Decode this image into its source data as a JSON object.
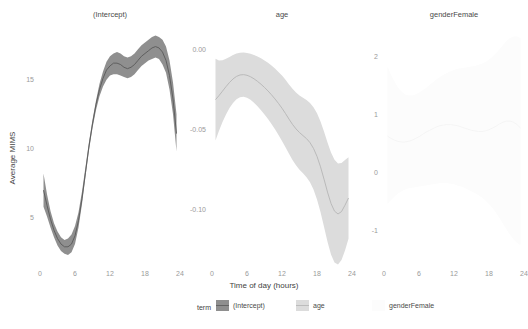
{
  "figure": {
    "background": "#ffffff",
    "axis_label_x": "Time of day (hours)",
    "axis_label_y": "Average MIMS"
  },
  "legend": {
    "title": "term",
    "position": "bottom",
    "entries": [
      {
        "label": "(Intercept)",
        "color": "#8f8f8f",
        "line_color": "#595959"
      },
      {
        "label": "age",
        "color": "#dcdcdc",
        "line_color": "#b4b4b4"
      },
      {
        "label": "genderFemale",
        "color": "#fcfcfc",
        "line_color": "#f2f2f2"
      }
    ]
  },
  "chart_data": {
    "type": "line",
    "title": "",
    "subtitle": "",
    "xlabel": "Time of day (hours)",
    "ylabel": "Average MIMS",
    "grid": false,
    "legend_position": "bottom",
    "facets": [
      {
        "name": "(Intercept)",
        "title": "(Intercept)",
        "color": "#8f8f8f",
        "line_color": "#595959",
        "xlim": [
          0,
          24
        ],
        "ylim": [
          1.8,
          18.6
        ],
        "xticks": [
          0,
          6,
          12,
          18,
          24
        ],
        "xtick_labels": [
          "0",
          "6",
          "12",
          "18",
          "24"
        ],
        "yticks": [
          5,
          10,
          15
        ],
        "ytick_labels": [
          "5",
          "10",
          "15"
        ],
        "x": [
          0.6,
          1.2,
          1.8,
          2.4,
          3.0,
          3.6,
          4.2,
          4.8,
          5.4,
          6.0,
          6.6,
          7.2,
          7.8,
          8.4,
          9.0,
          9.6,
          10.2,
          10.8,
          11.4,
          12.0,
          12.6,
          13.2,
          13.8,
          14.4,
          15.0,
          15.6,
          16.2,
          16.8,
          17.4,
          18.0,
          18.6,
          19.2,
          19.8,
          20.4,
          21.0,
          21.6,
          22.2,
          22.8,
          23.4
        ],
        "fit": [
          7.0,
          5.9,
          4.9,
          4.1,
          3.5,
          3.1,
          2.9,
          2.9,
          3.1,
          3.7,
          4.8,
          6.4,
          8.3,
          10.2,
          11.8,
          13.2,
          14.3,
          15.1,
          15.7,
          16.0,
          16.2,
          16.2,
          16.1,
          15.9,
          15.8,
          15.9,
          16.1,
          16.4,
          16.7,
          16.9,
          17.1,
          17.3,
          17.4,
          17.3,
          17.0,
          16.4,
          15.3,
          13.6,
          11.1
        ],
        "lower": [
          5.8,
          5.1,
          4.3,
          3.6,
          3.0,
          2.6,
          2.4,
          2.3,
          2.5,
          3.1,
          4.3,
          6.0,
          8.0,
          9.9,
          11.5,
          12.8,
          13.8,
          14.5,
          15.0,
          15.3,
          15.4,
          15.4,
          15.3,
          15.2,
          15.1,
          15.2,
          15.4,
          15.7,
          16.0,
          16.2,
          16.4,
          16.5,
          16.6,
          16.5,
          16.1,
          15.5,
          14.3,
          12.5,
          9.8
        ],
        "upper": [
          8.2,
          6.7,
          5.5,
          4.6,
          4.0,
          3.6,
          3.4,
          3.5,
          3.8,
          4.4,
          5.4,
          6.9,
          8.7,
          10.5,
          12.1,
          13.5,
          14.7,
          15.6,
          16.3,
          16.7,
          16.9,
          17.0,
          16.9,
          16.7,
          16.6,
          16.7,
          16.9,
          17.2,
          17.5,
          17.7,
          17.9,
          18.1,
          18.2,
          18.1,
          17.9,
          17.4,
          16.4,
          14.8,
          12.5
        ]
      },
      {
        "name": "age",
        "title": "age",
        "color": "#dcdcdc",
        "line_color": "#b6b6b6",
        "xlim": [
          0,
          24
        ],
        "ylim": [
          -0.133,
          0.012
        ],
        "xticks": [
          0,
          6,
          12,
          18,
          24
        ],
        "xtick_labels": [
          "0",
          "6",
          "12",
          "18",
          "24"
        ],
        "yticks": [
          0.0,
          -0.05,
          -0.1
        ],
        "ytick_labels": [
          "0.00",
          "-0.05",
          "-0.10"
        ],
        "x": [
          0.6,
          1.2,
          1.8,
          2.4,
          3.0,
          3.6,
          4.2,
          4.8,
          5.4,
          6.0,
          6.6,
          7.2,
          7.8,
          8.4,
          9.0,
          9.6,
          10.2,
          10.8,
          11.4,
          12.0,
          12.6,
          13.2,
          13.8,
          14.4,
          15.0,
          15.6,
          16.2,
          16.8,
          17.4,
          18.0,
          18.6,
          19.2,
          19.8,
          20.4,
          21.0,
          21.6,
          22.2,
          22.8,
          23.4
        ],
        "fit": [
          -0.0315,
          -0.029,
          -0.0262,
          -0.0234,
          -0.0208,
          -0.0186,
          -0.017,
          -0.0161,
          -0.0159,
          -0.0163,
          -0.0172,
          -0.0185,
          -0.0201,
          -0.0219,
          -0.0239,
          -0.0261,
          -0.0285,
          -0.0311,
          -0.0339,
          -0.0369,
          -0.0402,
          -0.0437,
          -0.047,
          -0.0498,
          -0.0521,
          -0.054,
          -0.0559,
          -0.0584,
          -0.062,
          -0.067,
          -0.0735,
          -0.0812,
          -0.0893,
          -0.0964,
          -0.1012,
          -0.103,
          -0.1015,
          -0.0975,
          -0.093
        ],
        "lower": [
          -0.057,
          -0.051,
          -0.0455,
          -0.0408,
          -0.0368,
          -0.0336,
          -0.0313,
          -0.03,
          -0.0297,
          -0.0303,
          -0.0316,
          -0.0334,
          -0.0356,
          -0.0381,
          -0.0408,
          -0.0437,
          -0.0468,
          -0.0501,
          -0.0536,
          -0.0573,
          -0.0613,
          -0.0654,
          -0.0693,
          -0.0726,
          -0.0753,
          -0.0776,
          -0.08,
          -0.0832,
          -0.0877,
          -0.0939,
          -0.1018,
          -0.111,
          -0.1203,
          -0.1283,
          -0.1333,
          -0.1345,
          -0.1318,
          -0.1258,
          -0.1185
        ],
        "upper": [
          -0.006,
          -0.007,
          -0.0069,
          -0.006,
          -0.0048,
          -0.0036,
          -0.0027,
          -0.0022,
          -0.0021,
          -0.0023,
          -0.0028,
          -0.0036,
          -0.0046,
          -0.0057,
          -0.007,
          -0.0085,
          -0.0102,
          -0.0121,
          -0.0142,
          -0.0165,
          -0.0191,
          -0.022,
          -0.0247,
          -0.027,
          -0.0289,
          -0.0304,
          -0.0318,
          -0.0336,
          -0.0363,
          -0.0401,
          -0.0452,
          -0.0514,
          -0.0583,
          -0.0645,
          -0.0691,
          -0.0715,
          -0.0712,
          -0.0692,
          -0.0675
        ]
      },
      {
        "name": "genderFemale",
        "title": "genderFemale",
        "color": "#fcfcfc",
        "line_color": "#f4f4f4",
        "xlim": [
          0,
          24
        ],
        "ylim": [
          -1.55,
          2.45
        ],
        "xticks": [
          0,
          6,
          12,
          18,
          24
        ],
        "xtick_labels": [
          "0",
          "6",
          "12",
          "18",
          "24"
        ],
        "yticks": [
          2,
          1,
          0,
          -1
        ],
        "ytick_labels": [
          "2",
          "1",
          "0",
          "-1"
        ],
        "x": [
          0.6,
          1.2,
          1.8,
          2.4,
          3.0,
          3.6,
          4.2,
          4.8,
          5.4,
          6.0,
          6.6,
          7.2,
          7.8,
          8.4,
          9.0,
          9.6,
          10.2,
          10.8,
          11.4,
          12.0,
          12.6,
          13.2,
          13.8,
          14.4,
          15.0,
          15.6,
          16.2,
          16.8,
          17.4,
          18.0,
          18.6,
          19.2,
          19.8,
          20.4,
          21.0,
          21.6,
          22.2,
          22.8,
          23.4
        ],
        "fit": [
          0.62,
          0.58,
          0.55,
          0.53,
          0.52,
          0.52,
          0.53,
          0.55,
          0.58,
          0.61,
          0.65,
          0.69,
          0.72,
          0.75,
          0.78,
          0.8,
          0.81,
          0.82,
          0.82,
          0.81,
          0.8,
          0.78,
          0.76,
          0.74,
          0.72,
          0.71,
          0.7,
          0.7,
          0.71,
          0.73,
          0.76,
          0.79,
          0.83,
          0.86,
          0.88,
          0.88,
          0.86,
          0.82,
          0.76
        ],
        "lower": [
          -0.55,
          -0.48,
          -0.42,
          -0.37,
          -0.33,
          -0.3,
          -0.28,
          -0.27,
          -0.26,
          -0.25,
          -0.24,
          -0.23,
          -0.22,
          -0.21,
          -0.2,
          -0.19,
          -0.19,
          -0.19,
          -0.2,
          -0.21,
          -0.23,
          -0.25,
          -0.27,
          -0.3,
          -0.33,
          -0.36,
          -0.4,
          -0.44,
          -0.49,
          -0.55,
          -0.62,
          -0.7,
          -0.79,
          -0.89,
          -0.99,
          -1.08,
          -1.16,
          -1.22,
          -1.26
        ],
        "upper": [
          1.82,
          1.68,
          1.56,
          1.46,
          1.39,
          1.34,
          1.32,
          1.32,
          1.34,
          1.37,
          1.41,
          1.45,
          1.5,
          1.55,
          1.6,
          1.64,
          1.68,
          1.71,
          1.74,
          1.76,
          1.78,
          1.79,
          1.8,
          1.81,
          1.82,
          1.83,
          1.85,
          1.87,
          1.9,
          1.94,
          1.99,
          2.05,
          2.12,
          2.19,
          2.26,
          2.31,
          2.34,
          2.34,
          2.31
        ]
      }
    ]
  }
}
